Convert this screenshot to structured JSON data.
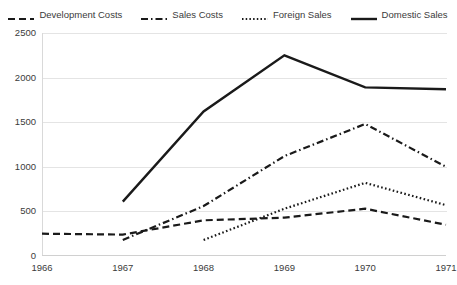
{
  "chart_data": {
    "type": "line",
    "title": "",
    "subtitle": "",
    "xlabel": "",
    "ylabel": "",
    "categories": [
      "1966",
      "1967",
      "1968",
      "1969",
      "1970",
      "1971"
    ],
    "x": [
      1966,
      1967,
      1968,
      1969,
      1970,
      1971
    ],
    "xlim": [
      1966,
      1971
    ],
    "ylim": [
      0,
      2500
    ],
    "ytick_labels": [
      "0",
      "500",
      "1000",
      "1500",
      "2000",
      "2500"
    ],
    "ytick_values": [
      0,
      500,
      1000,
      1500,
      2000,
      2500
    ],
    "ytick_step": 500,
    "grid": "horizontal",
    "legend_position": "top-center",
    "series": [
      {
        "name": "Development Costs",
        "style": "dashed",
        "color": "#1a1a1a",
        "values": [
          250,
          240,
          400,
          430,
          530,
          350
        ]
      },
      {
        "name": "Sales Costs",
        "style": "dash-dot",
        "color": "#1a1a1a",
        "values": [
          null,
          180,
          560,
          1120,
          1480,
          1000
        ]
      },
      {
        "name": "Foreign Sales",
        "style": "dotted",
        "color": "#1a1a1a",
        "values": [
          null,
          null,
          180,
          530,
          820,
          570
        ]
      },
      {
        "name": "Domestic Sales",
        "style": "solid",
        "color": "#1a1a1a",
        "values": [
          null,
          610,
          1620,
          2250,
          1890,
          1870
        ]
      }
    ]
  },
  "legend": {
    "items": [
      {
        "label": "Development Costs",
        "style": "dashed"
      },
      {
        "label": "Sales Costs",
        "style": "dash-dot"
      },
      {
        "label": "Foreign Sales",
        "style": "dotted"
      },
      {
        "label": "Domestic Sales",
        "style": "solid"
      }
    ]
  }
}
